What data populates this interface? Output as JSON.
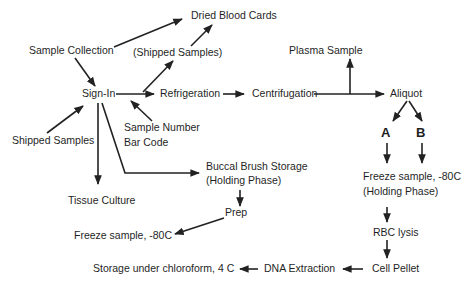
{
  "diagram": {
    "type": "flowchart",
    "nodes": {
      "dried_blood_cards": "Dried Blood Cards",
      "sample_collection": "Sample Collection",
      "shipped_samples_paren": "(Shipped Samples)",
      "sign_in": "Sign-In",
      "refrigeration": "Refrigeration",
      "centrifugation": "Centrifugation",
      "plasma_sample": "Plasma Sample",
      "aliquot": "Aliquot",
      "shipped_samples": "Shipped Samples",
      "sample_number": "Sample Number",
      "bar_code": "Bar Code",
      "buccal_brush_storage": "Buccal Brush Storage",
      "buccal_holding_phase": "(Holding Phase)",
      "tissue_culture": "Tissue Culture",
      "prep": "Prep",
      "freeze_left": "Freeze sample, -80C",
      "branch_a": "A",
      "branch_b": "B",
      "freeze_right": "Freeze sample, -80C",
      "freeze_right_holding": "(Holding Phase)",
      "rbc_lysis": "RBC lysis",
      "cell_pellet": "Cell Pellet",
      "dna_extraction": "DNA Extraction",
      "storage_chloroform": "Storage under chloroform, 4 C"
    },
    "edges": [
      {
        "from": "Sample Collection",
        "to": "Dried Blood Cards"
      },
      {
        "from": "Sample Collection",
        "to": "Sign-In"
      },
      {
        "from": "Sign-In",
        "to": "(Shipped Samples)"
      },
      {
        "from": "(Shipped Samples)",
        "to": "Dried Blood Cards"
      },
      {
        "from": "Sign-In",
        "to": "Refrigeration"
      },
      {
        "from": "Refrigeration",
        "to": "Centrifugation"
      },
      {
        "from": "Centrifugation",
        "to": "Plasma Sample"
      },
      {
        "from": "Centrifugation",
        "to": "Aliquot"
      },
      {
        "from": "Shipped Samples",
        "to": "Sign-In"
      },
      {
        "from": "Sample Number Bar Code",
        "to": "Sign-In"
      },
      {
        "from": "Sign-In",
        "to": "Tissue Culture"
      },
      {
        "from": "Sign-In",
        "to": "Buccal Brush Storage (Holding Phase)"
      },
      {
        "from": "Buccal Brush Storage (Holding Phase)",
        "to": "Prep"
      },
      {
        "from": "Prep",
        "to": "Freeze sample, -80C"
      },
      {
        "from": "Aliquot",
        "to": "A"
      },
      {
        "from": "Aliquot",
        "to": "B"
      },
      {
        "from": "A",
        "to": "Freeze sample, -80C (Holding Phase)"
      },
      {
        "from": "B",
        "to": "Freeze sample, -80C (Holding Phase)"
      },
      {
        "from": "Freeze sample, -80C (Holding Phase)",
        "to": "RBC lysis"
      },
      {
        "from": "RBC lysis",
        "to": "Cell Pellet"
      },
      {
        "from": "Cell Pellet",
        "to": "DNA Extraction"
      },
      {
        "from": "DNA Extraction",
        "to": "Storage under chloroform, 4 C"
      }
    ]
  }
}
